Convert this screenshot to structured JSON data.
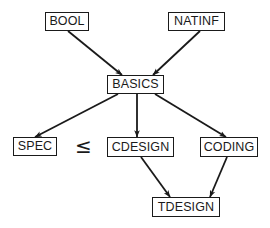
{
  "diagram": {
    "nodes": [
      {
        "id": "BOOL",
        "label": "BOOL",
        "x": 45,
        "y": 12,
        "w": 44,
        "h": 19
      },
      {
        "id": "NATINF",
        "label": "NATINF",
        "x": 168,
        "y": 12,
        "w": 57,
        "h": 19
      },
      {
        "id": "BASICS",
        "label": "BASICS",
        "x": 107,
        "y": 75,
        "w": 57,
        "h": 19
      },
      {
        "id": "SPEC",
        "label": "SPEC",
        "x": 13,
        "y": 137,
        "w": 44,
        "h": 19
      },
      {
        "id": "CDESIGN",
        "label": "CDESIGN",
        "x": 107,
        "y": 137,
        "w": 67,
        "h": 20
      },
      {
        "id": "CODING",
        "label": "CODING",
        "x": 200,
        "y": 137,
        "w": 58,
        "h": 20
      },
      {
        "id": "TDESIGN",
        "label": "TDESIGN",
        "x": 152,
        "y": 197,
        "w": 68,
        "h": 20
      }
    ],
    "edges": [
      {
        "from": "BOOL",
        "to": "BASICS",
        "x1": 68,
        "y1": 31,
        "x2": 122,
        "y2": 75
      },
      {
        "from": "NATINF",
        "to": "BASICS",
        "x1": 200,
        "y1": 31,
        "x2": 153,
        "y2": 75
      },
      {
        "from": "BASICS",
        "to": "SPEC",
        "x1": 118,
        "y1": 94,
        "x2": 35,
        "y2": 137
      },
      {
        "from": "BASICS",
        "to": "CDESIGN",
        "x1": 137,
        "y1": 94,
        "x2": 137,
        "y2": 137
      },
      {
        "from": "BASICS",
        "to": "CODING",
        "x1": 155,
        "y1": 94,
        "x2": 226,
        "y2": 137
      },
      {
        "from": "CDESIGN",
        "to": "TDESIGN",
        "x1": 141,
        "y1": 157,
        "x2": 170,
        "y2": 197
      },
      {
        "from": "CODING",
        "to": "TDESIGN",
        "x1": 227,
        "y1": 157,
        "x2": 210,
        "y2": 197
      }
    ],
    "relation": {
      "symbol": "≤",
      "between": [
        "SPEC",
        "CDESIGN"
      ],
      "x": 75,
      "y": 136
    },
    "colors": {
      "stroke": "#1a1a1a",
      "background": "#ffffff"
    }
  }
}
